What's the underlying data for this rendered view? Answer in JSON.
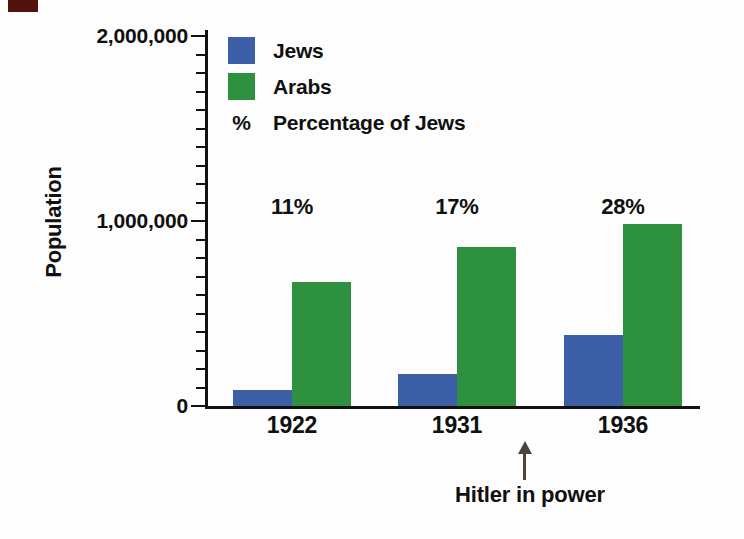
{
  "figure": {
    "background_color": "#fdfdfd",
    "corner_mark_color": "#54120d",
    "axis_color": "#111111",
    "arrow_color": "#4e4339"
  },
  "chart_data": {
    "type": "bar",
    "title": "",
    "xlabel": "",
    "ylabel": "Population",
    "categories": [
      "1922",
      "1931",
      "1936"
    ],
    "series": [
      {
        "name": "Jews",
        "color": "#3c5fa7",
        "values": [
          84000,
          175000,
          384000
        ]
      },
      {
        "name": "Arabs",
        "color": "#2d9140",
        "values": [
          670000,
          860000,
          985000
        ]
      }
    ],
    "percent_of_jews_labels": [
      "11%",
      "17%",
      "28%"
    ],
    "ylim": [
      0,
      2000000
    ],
    "y_major_ticks": [
      {
        "value": 0,
        "label": "0"
      },
      {
        "value": 1000000,
        "label": "1,000,000"
      },
      {
        "value": 2000000,
        "label": "2,000,000"
      }
    ],
    "y_minor_tick_step": 100000,
    "grid": false,
    "legend": {
      "position": "top-left-inside",
      "items": [
        {
          "swatch_color": "#3c5fa7",
          "label": "Jews"
        },
        {
          "swatch_color": "#2d9140",
          "label": "Arabs"
        },
        {
          "symbol": "%",
          "label": "Percentage of Jews"
        }
      ]
    },
    "annotation": {
      "text": "Hitler in power",
      "arrow_direction": "up",
      "points_between": [
        "1931",
        "1936"
      ]
    }
  }
}
